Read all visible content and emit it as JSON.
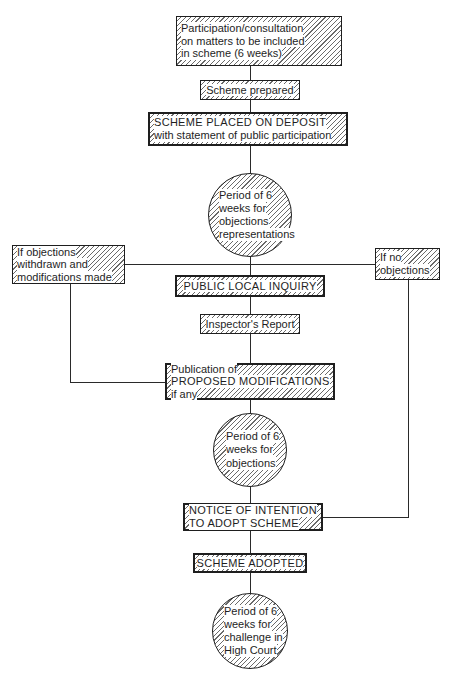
{
  "diagram": {
    "type": "flowchart",
    "nodes": {
      "participation": {
        "shape": "box",
        "lines": [
          "Participation/consultation",
          "on matters to be included",
          "in scheme (6 weeks)"
        ]
      },
      "prepared": {
        "shape": "box",
        "lines": [
          "Scheme prepared"
        ]
      },
      "deposit": {
        "shape": "box",
        "lines": [
          "SCHEME PLACED ON DEPOSIT",
          "with statement of public participation"
        ]
      },
      "period1": {
        "shape": "circle",
        "lines": [
          "Period of 6",
          "weeks for",
          "objections",
          "representations"
        ]
      },
      "withdrawn": {
        "shape": "box",
        "lines": [
          "If objections",
          "withdrawn and",
          "modifications made"
        ]
      },
      "no_objections": {
        "shape": "box",
        "lines": [
          "If no",
          "objections"
        ]
      },
      "inquiry": {
        "shape": "box",
        "lines": [
          "PUBLIC LOCAL INQUIRY"
        ]
      },
      "report": {
        "shape": "box",
        "lines": [
          "Inspector's Report"
        ]
      },
      "publication": {
        "shape": "box",
        "lines": [
          "Publication of",
          "PROPOSED MODIFICATIONS",
          "if any"
        ]
      },
      "period2": {
        "shape": "circle",
        "lines": [
          "Period of 6",
          "weeks for",
          "objections"
        ]
      },
      "notice": {
        "shape": "box",
        "lines": [
          "NOTICE OF INTENTION",
          "TO ADOPT SCHEME"
        ]
      },
      "adopted": {
        "shape": "box",
        "lines": [
          "SCHEME ADOPTED"
        ]
      },
      "period3": {
        "shape": "circle",
        "lines": [
          "Period of 6",
          "weeks for",
          "challenge in",
          "High Court"
        ]
      }
    },
    "edges": [
      [
        "participation",
        "prepared"
      ],
      [
        "prepared",
        "deposit"
      ],
      [
        "deposit",
        "period1"
      ],
      [
        "period1",
        "inquiry"
      ],
      [
        "period1",
        "withdrawn"
      ],
      [
        "period1",
        "no_objections"
      ],
      [
        "inquiry",
        "report"
      ],
      [
        "report",
        "publication"
      ],
      [
        "withdrawn",
        "publication"
      ],
      [
        "publication",
        "period2"
      ],
      [
        "period2",
        "notice"
      ],
      [
        "no_objections",
        "notice"
      ],
      [
        "notice",
        "adopted"
      ],
      [
        "adopted",
        "period3"
      ]
    ]
  }
}
